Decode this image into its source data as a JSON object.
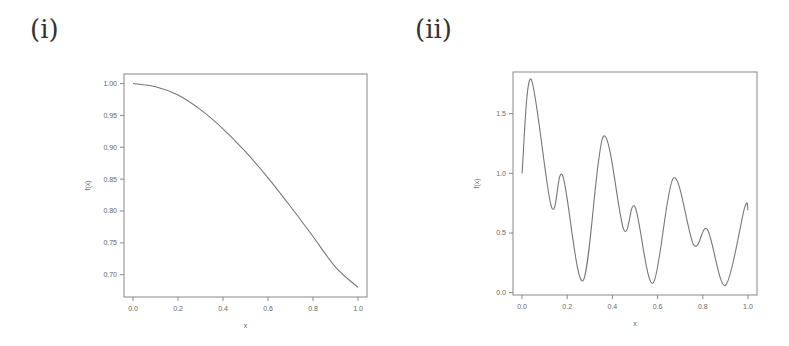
{
  "panels": [
    {
      "label": "(i)"
    },
    {
      "label": "(ii)"
    }
  ],
  "chart_data": [
    {
      "type": "line",
      "panel": "(i)",
      "title": "",
      "xlabel": "x",
      "ylabel": "f(x)",
      "xlim": [
        -0.04,
        1.04
      ],
      "ylim": [
        0.665,
        1.015
      ],
      "xticks": [
        "0.0",
        "0.2",
        "0.4",
        "0.6",
        "0.8",
        "1.0"
      ],
      "yticks": [
        "0.70",
        "0.75",
        "0.80",
        "0.85",
        "0.90",
        "0.95",
        "1.00"
      ],
      "grid": false,
      "legend": null,
      "x": [
        0.0,
        0.1,
        0.2,
        0.3,
        0.4,
        0.5,
        0.6,
        0.7,
        0.8,
        0.9,
        1.0
      ],
      "y": [
        1.0,
        0.995,
        0.982,
        0.959,
        0.929,
        0.893,
        0.852,
        0.807,
        0.76,
        0.712,
        0.68
      ]
    },
    {
      "type": "line",
      "panel": "(ii)",
      "title": "",
      "xlabel": "x",
      "ylabel": "f(x)",
      "xlim": [
        -0.04,
        1.04
      ],
      "ylim": [
        -0.02,
        1.85
      ],
      "xticks": [
        "0.0",
        "0.2",
        "0.4",
        "0.6",
        "0.8",
        "1.0"
      ],
      "yticks": [
        "0.0",
        "0.5",
        "1.0",
        "1.5"
      ],
      "grid": false,
      "legend": null,
      "x": [
        0.0,
        0.04,
        0.13,
        0.18,
        0.27,
        0.36,
        0.45,
        0.5,
        0.58,
        0.67,
        0.76,
        0.82,
        0.9,
        0.985,
        1.0
      ],
      "y": [
        1.0,
        1.79,
        0.72,
        0.98,
        0.1,
        1.31,
        0.53,
        0.72,
        0.08,
        0.96,
        0.4,
        0.53,
        0.06,
        0.71,
        0.69
      ]
    }
  ]
}
